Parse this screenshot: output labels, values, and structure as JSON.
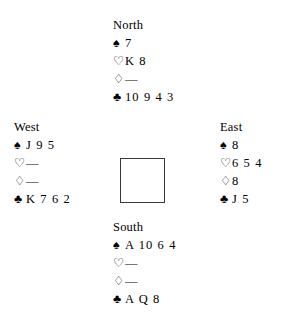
{
  "diagram": {
    "type": "bridge-deal",
    "suit_symbols": {
      "spade": "♠",
      "heart": "♡",
      "diamond": "♢",
      "club": "♣"
    },
    "void_mark": "—",
    "hands": {
      "north": {
        "label": "North",
        "spades": "7",
        "hearts": "K 8",
        "diamonds": "—",
        "clubs": "10 9 4 3"
      },
      "west": {
        "label": "West",
        "spades": "J 9 5",
        "hearts": "—",
        "diamonds": "—",
        "clubs": "K 7 6 2"
      },
      "east": {
        "label": "East",
        "spades": "8",
        "hearts": "6 5 4",
        "diamonds": "8",
        "clubs": "J 5"
      },
      "south": {
        "label": "South",
        "spades": "A 10 6 4",
        "hearts": "—",
        "diamonds": "—",
        "clubs": "A Q 8"
      }
    }
  }
}
